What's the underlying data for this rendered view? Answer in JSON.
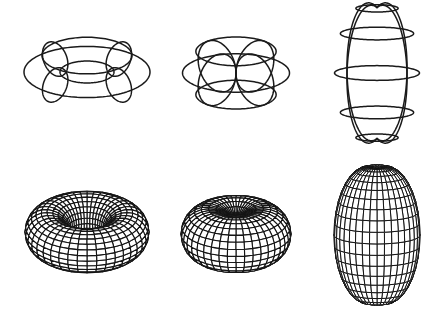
{
  "figure": {
    "title": "Ring, horn and spindle tori: wireframe and mesh renderings",
    "background": "#ffffff",
    "stroke_color": "#1a1a1a"
  },
  "shapes": [
    {
      "id": "ring-torus-wireframe",
      "label": "Ring torus (wireframe)",
      "row": 1,
      "col": 1,
      "style": "wireframe",
      "cx": 87,
      "cy": 72,
      "R": 45,
      "r": 18,
      "zscale": 1.0,
      "tilt_deg": 66,
      "meridians": 4,
      "meridian_offset_deg": 45,
      "parallels_deg": [
        0,
        90,
        180,
        270
      ],
      "stroke_width": 1.5
    },
    {
      "id": "horn-torus-wireframe",
      "label": "Horn torus (wireframe)",
      "row": 1,
      "col": 2,
      "style": "wireframe",
      "cx": 236,
      "cy": 73,
      "R": 26.75,
      "r": 26.75,
      "zscale": 1.0,
      "tilt_deg": 69,
      "meridians": 4,
      "meridian_offset_deg": 45,
      "parallels_deg": [
        0,
        60,
        -60,
        180
      ],
      "stroke_width": 1.5
    },
    {
      "id": "spindle-torus-wireframe",
      "label": "Spindle torus (wireframe)",
      "row": 1,
      "col": 3,
      "style": "wireframe",
      "cx": 377,
      "cy": 73,
      "R": 10,
      "r": 32.5,
      "zscale": 2.15,
      "tilt_deg": 80,
      "meridians": 4,
      "meridian_offset_deg": 45,
      "parallels_deg": [
        0,
        35,
        -35,
        70,
        -70
      ],
      "stroke_width": 1.5
    },
    {
      "id": "ring-torus-mesh",
      "label": "Ring torus (mesh)",
      "row": 2,
      "col": 1,
      "style": "mesh",
      "cx": 87,
      "cy": 232,
      "R": 40,
      "r": 22,
      "zscale": 1.0,
      "tilt_deg": 62,
      "u_steps": 40,
      "v_steps": 24,
      "stroke_width": 1.1
    },
    {
      "id": "horn-torus-mesh",
      "label": "Horn torus (mesh)",
      "row": 2,
      "col": 2,
      "style": "mesh",
      "cx": 236,
      "cy": 234,
      "R": 27.5,
      "r": 27.5,
      "zscale": 1.0,
      "tilt_deg": 66,
      "u_steps": 40,
      "v_steps": 24,
      "stroke_width": 1.1
    },
    {
      "id": "spindle-torus-mesh",
      "label": "Spindle torus (mesh)",
      "row": 2,
      "col": 3,
      "style": "mesh",
      "cx": 377,
      "cy": 235,
      "R": 10,
      "r": 33,
      "zscale": 2.1,
      "tilt_deg": 78,
      "u_steps": 36,
      "v_steps": 22,
      "stroke_width": 1.0
    }
  ]
}
